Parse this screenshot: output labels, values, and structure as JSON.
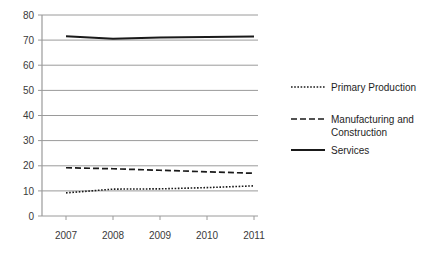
{
  "chart_data": {
    "type": "line",
    "title": "",
    "xlabel": "",
    "ylabel": "",
    "x": [
      "2007",
      "2008",
      "2009",
      "2010",
      "2011"
    ],
    "categories": [
      "2007",
      "2008",
      "2009",
      "2010",
      "2011"
    ],
    "ylim": [
      0,
      80
    ],
    "yticks": [
      "0",
      "10",
      "20",
      "30",
      "40",
      "50",
      "60",
      "70",
      "80"
    ],
    "grid": "horizontal",
    "legend_position": "right",
    "series": [
      {
        "name": "Primary Production",
        "style": "dotted",
        "color": "#1a1a1a",
        "values": [
          9.2,
          10.7,
          10.8,
          11.3,
          12.0
        ]
      },
      {
        "name": "Manufacturing and Construction",
        "style": "dashed",
        "color": "#1a1a1a",
        "values": [
          19.2,
          18.8,
          18.2,
          17.6,
          17.0
        ]
      },
      {
        "name": "Services",
        "style": "solid",
        "color": "#1a1a1a",
        "values": [
          71.5,
          70.5,
          71.0,
          71.2,
          71.4
        ]
      }
    ]
  },
  "axis": {
    "y_tick_0": "0",
    "y_tick_1": "10",
    "y_tick_2": "20",
    "y_tick_3": "30",
    "y_tick_4": "40",
    "y_tick_5": "50",
    "y_tick_6": "60",
    "y_tick_7": "70",
    "y_tick_8": "80",
    "x_tick_0": "2007",
    "x_tick_1": "2008",
    "x_tick_2": "2009",
    "x_tick_3": "2010",
    "x_tick_4": "2011"
  },
  "legend": {
    "entry_0": "Primary Production",
    "entry_1_line_1": "Manufacturing and",
    "entry_1_line_2": "Construction",
    "entry_2": "Services"
  },
  "colors": {
    "line": "#1a1a1a",
    "grid": "#9a9a9a",
    "axis": "#9a9a9a",
    "tick_label": "#3a3a3a",
    "legend_label": "#1e1e1e",
    "background": "#ffffff"
  }
}
